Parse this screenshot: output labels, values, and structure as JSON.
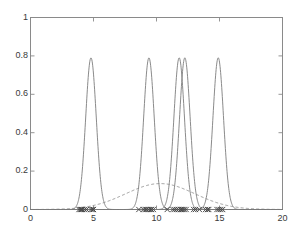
{
  "chart_data": {
    "type": "line",
    "title": "",
    "xlabel": "",
    "ylabel": "",
    "xlim": [
      0,
      20
    ],
    "ylim": [
      0,
      1
    ],
    "grid": false,
    "legend": "none",
    "xticks": [
      "0",
      "5",
      "10",
      "15",
      "20"
    ],
    "xtick_values": [
      0,
      5,
      10,
      15,
      20
    ],
    "yticks": [
      "0",
      "0.2",
      "0.4",
      "0.6",
      "0.8",
      "1"
    ],
    "ytick_values": [
      0,
      0.2,
      0.4,
      0.6,
      0.8,
      1
    ],
    "series": [
      {
        "name": "component-1",
        "style": "solid",
        "color": "#7d7d7d",
        "type": "gaussian",
        "mean": 4.8,
        "sigma": 0.42,
        "peak": 0.79
      },
      {
        "name": "component-2",
        "style": "solid",
        "color": "#7d7d7d",
        "type": "gaussian",
        "mean": 9.4,
        "sigma": 0.42,
        "peak": 0.79
      },
      {
        "name": "component-3",
        "style": "solid",
        "color": "#7d7d7d",
        "type": "gaussian",
        "mean": 11.8,
        "sigma": 0.42,
        "peak": 0.79
      },
      {
        "name": "component-4",
        "style": "solid",
        "color": "#7d7d7d",
        "type": "gaussian",
        "mean": 12.25,
        "sigma": 0.42,
        "peak": 0.79
      },
      {
        "name": "component-5",
        "style": "solid",
        "color": "#7d7d7d",
        "type": "gaussian",
        "mean": 14.9,
        "sigma": 0.42,
        "peak": 0.79
      },
      {
        "name": "broad-envelope",
        "style": "dashed",
        "color": "#7d7d7d",
        "type": "gaussian",
        "mean": 10.3,
        "sigma": 2.75,
        "peak": 0.135
      }
    ],
    "markers": {
      "name": "data-points",
      "symbol": "x",
      "color": "#4a4a4a",
      "y": 0,
      "x": [
        3.85,
        3.95,
        4.05,
        4.15,
        4.3,
        4.45,
        4.8,
        4.9,
        5.0,
        8.6,
        8.95,
        9.1,
        9.2,
        9.35,
        9.5,
        9.6,
        9.75,
        10.85,
        11.3,
        11.45,
        11.6,
        11.75,
        11.9,
        12.0,
        12.1,
        12.2,
        12.35,
        12.95,
        13.1,
        13.4,
        13.9,
        14.05,
        14.15,
        14.8,
        14.95,
        15.1,
        15.25
      ]
    }
  },
  "axes": {
    "frame_color": "#8a8a8a",
    "tick_color": "#8a8a8a",
    "label_color": "#3a3a3a"
  }
}
